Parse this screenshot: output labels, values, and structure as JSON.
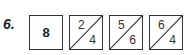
{
  "question": {
    "label": "6."
  },
  "boxes": [
    {
      "type": "whole",
      "value": "8"
    },
    {
      "type": "split",
      "top": "2",
      "bottom": "4"
    },
    {
      "type": "split",
      "top": "5",
      "bottom": "6"
    },
    {
      "type": "split",
      "top": "6",
      "bottom": "4"
    }
  ],
  "colors": {
    "stroke": "#333333",
    "background": "#ffffff"
  }
}
